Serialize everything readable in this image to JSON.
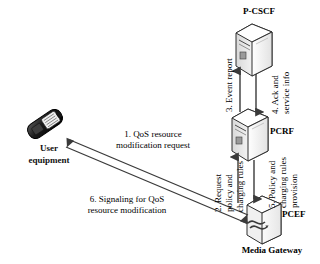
{
  "diagram": {
    "background_color": "#ffffff",
    "line_color": "#3a3a3a",
    "text_color": "#000000",
    "nodes": [
      {
        "id": "pcscf",
        "label": "P-CSCF",
        "icon": "server-tower-icon"
      },
      {
        "id": "pcrf",
        "label": "PCRF",
        "icon": "server-tower-icon"
      },
      {
        "id": "pcef",
        "label": "PCEF",
        "icon": "gateway-box-icon"
      },
      {
        "id": "gateway",
        "label": "Media Gateway",
        "icon": "gateway-box-icon"
      },
      {
        "id": "ue",
        "label_line1": "User",
        "label_line2": "equipment",
        "icon": "mobile-phone-icon"
      }
    ],
    "messages": [
      {
        "number": "1",
        "text_line1": "1. QoS resource",
        "text_line2": "modification request",
        "from": "gateway",
        "to": "ue",
        "orientation": "diagonal"
      },
      {
        "number": "2",
        "text_line1": "2. Request",
        "text_line2": "policy and",
        "text_line3": "charging rules",
        "from": "pcef",
        "to": "pcrf",
        "orientation": "vertical-up"
      },
      {
        "number": "3",
        "text_line1": "3. Event report",
        "from": "pcrf",
        "to": "pcscf",
        "orientation": "vertical-up"
      },
      {
        "number": "4",
        "text_line1": "4. Ack and",
        "text_line2": "service info",
        "from": "pcscf",
        "to": "pcrf",
        "orientation": "vertical-down"
      },
      {
        "number": "5",
        "text_line1": "5. Policy and",
        "text_line2": "charging rules",
        "text_line3": "provision",
        "from": "pcrf",
        "to": "pcef",
        "orientation": "vertical-down"
      },
      {
        "number": "6",
        "text_line1": "6. Signaling for QoS",
        "text_line2": "resource modification",
        "from": "ue",
        "to": "gateway",
        "orientation": "diagonal"
      }
    ]
  }
}
